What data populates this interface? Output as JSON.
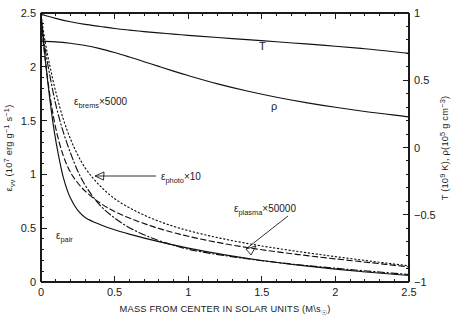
{
  "chart_data": {
    "type": "line",
    "title": "",
    "xlabel": "MASS FROM CENTER IN SOLAR UNITS (M\\s☉)",
    "ylabel_left": "ενν (10⁷ erg g⁻¹ s⁻¹)",
    "ylabel_right": "T (10⁹ K), ρ(10⁵ g cm⁻³)",
    "xlim": [
      0,
      2.5
    ],
    "ylim_left": [
      0,
      2.5
    ],
    "ylim_right": [
      -1,
      1
    ],
    "grid": false,
    "legend_position": "inline-annotations",
    "xticks": [
      "0",
      "0.5",
      "1",
      "1.5",
      "2",
      "2.5"
    ],
    "xtick_values": [
      0,
      0.5,
      1,
      1.5,
      2,
      2.5
    ],
    "yticks_left": [
      "0",
      "0.5",
      "1",
      "1.5",
      "2",
      "2.5"
    ],
    "ytick_values_left": [
      0,
      0.5,
      1,
      1.5,
      2,
      2.5
    ],
    "yticks_right": [
      "-1",
      "-0.5",
      "0",
      "0.5",
      "1"
    ],
    "ytick_values_right": [
      -1,
      -0.5,
      0,
      0.5,
      1
    ],
    "minor_ticks_per_interval": 4,
    "series": [
      {
        "name": "T",
        "label": "T",
        "axis": "right",
        "style": "solid",
        "x": [
          0,
          0.1,
          0.2,
          0.3,
          0.4,
          0.5,
          0.6,
          0.7,
          0.8,
          0.9,
          1.0,
          1.2,
          1.4,
          1.6,
          1.8,
          2.0,
          2.2,
          2.5
        ],
        "values": [
          0.99,
          0.96,
          0.935,
          0.915,
          0.9,
          0.885,
          0.873,
          0.862,
          0.852,
          0.843,
          0.834,
          0.818,
          0.802,
          0.786,
          0.77,
          0.753,
          0.734,
          0.7
        ]
      },
      {
        "name": "rho",
        "label": "ρ",
        "axis": "right",
        "style": "solid",
        "x": [
          0,
          0.1,
          0.2,
          0.3,
          0.4,
          0.5,
          0.6,
          0.7,
          0.8,
          0.9,
          1.0,
          1.2,
          1.4,
          1.6,
          1.8,
          2.0,
          2.2,
          2.5
        ],
        "values": [
          0.79,
          0.785,
          0.775,
          0.758,
          0.735,
          0.706,
          0.673,
          0.638,
          0.603,
          0.568,
          0.535,
          0.473,
          0.42,
          0.374,
          0.334,
          0.299,
          0.268,
          0.228
        ]
      },
      {
        "name": "epsilon_pair",
        "label": "εpair",
        "axis": "left",
        "style": "solid",
        "x": [
          0,
          0.03,
          0.06,
          0.09,
          0.12,
          0.15,
          0.2,
          0.25,
          0.3,
          0.4,
          0.5,
          0.6,
          0.8,
          1.0,
          1.25,
          1.5,
          1.75,
          2.0,
          2.25,
          2.5
        ],
        "values": [
          2.5,
          2.06,
          1.7,
          1.4,
          1.17,
          0.98,
          0.78,
          0.665,
          0.6,
          0.535,
          0.485,
          0.445,
          0.375,
          0.315,
          0.252,
          0.2,
          0.157,
          0.12,
          0.088,
          0.06
        ]
      },
      {
        "name": "epsilon_photo_x10",
        "label": "εphoto×10",
        "axis": "left",
        "style": "dashed",
        "x": [
          0,
          0.03,
          0.06,
          0.1,
          0.15,
          0.2,
          0.25,
          0.3,
          0.4,
          0.5,
          0.6,
          0.8,
          1.0,
          1.25,
          1.5,
          1.75,
          2.0,
          2.25,
          2.5
        ],
        "values": [
          2.42,
          2.05,
          1.74,
          1.43,
          1.18,
          1.02,
          0.92,
          0.845,
          0.735,
          0.655,
          0.595,
          0.498,
          0.425,
          0.355,
          0.3,
          0.255,
          0.215,
          0.178,
          0.14
        ]
      },
      {
        "name": "epsilon_plasma_x50000",
        "label": "εplasma×50000",
        "axis": "left",
        "style": "dashdot",
        "x": [
          0,
          0.03,
          0.06,
          0.1,
          0.15,
          0.2,
          0.25,
          0.3,
          0.4,
          0.5,
          0.6,
          0.8,
          1.0,
          1.1,
          1.25,
          1.5,
          1.75,
          2.0,
          2.25,
          2.5
        ],
        "values": [
          2.42,
          2.15,
          1.92,
          1.65,
          1.4,
          1.2,
          1.03,
          0.9,
          0.715,
          0.595,
          0.505,
          0.385,
          0.305,
          0.278,
          0.245,
          0.198,
          0.16,
          0.128,
          0.098,
          0.07
        ]
      },
      {
        "name": "epsilon_brems_x5000",
        "label": "εbrems×5000",
        "axis": "left",
        "style": "dotted",
        "x": [
          0,
          0.03,
          0.06,
          0.1,
          0.15,
          0.2,
          0.25,
          0.3,
          0.4,
          0.5,
          0.6,
          0.8,
          1.0,
          1.25,
          1.5,
          1.75,
          2.0,
          2.25,
          2.5
        ],
        "values": [
          2.48,
          2.22,
          2.01,
          1.77,
          1.52,
          1.33,
          1.18,
          1.06,
          0.895,
          0.775,
          0.69,
          0.565,
          0.478,
          0.398,
          0.335,
          0.283,
          0.236,
          0.192,
          0.15
        ]
      }
    ],
    "annotations": [
      {
        "id": "brems",
        "text": "εbrems×5000",
        "base": "ε",
        "sub": "brems",
        "suffix": "×5000"
      },
      {
        "id": "photo",
        "text": "εphoto×10",
        "base": "ε",
        "sub": "photo",
        "suffix": "×10"
      },
      {
        "id": "plasma",
        "text": "εplasma×50000",
        "base": "ε",
        "sub": "plasma",
        "suffix": "×50000"
      },
      {
        "id": "pair",
        "text": "εpair",
        "base": "ε",
        "sub": "pair",
        "suffix": ""
      },
      {
        "id": "t",
        "text": "T"
      },
      {
        "id": "rho",
        "text": "ρ"
      }
    ]
  },
  "labels": {
    "x_axis_title_main": "MASS FROM CENTER IN SOLAR UNITS (M\\s",
    "x_axis_title_sun": "☉",
    "x_axis_title_close": ")",
    "y_left_eps": "ε",
    "y_left_sub": "νν",
    "y_left_open": " (10",
    "y_left_exp1": "7",
    "y_left_mid": " erg g",
    "y_left_exp2": "−1",
    "y_left_mid2": " s",
    "y_left_exp3": "−1",
    "y_left_close": ")",
    "y_right_t": "T (10",
    "y_right_exp1": "9",
    "y_right_mid": " K), ",
    "y_right_rho": "ρ(10",
    "y_right_exp2": "5",
    "y_right_mid2": " g cm",
    "y_right_exp3": "−3",
    "y_right_close": ")",
    "label_T": "T",
    "label_rho": "ρ",
    "label_pair_base": "ε",
    "label_pair_sub": "pair",
    "label_brems_base": "ε",
    "label_brems_sub": "brems",
    "label_brems_suffix": "×5000",
    "label_photo_base": "ε",
    "label_photo_sub": "photo",
    "label_photo_suffix": "×10",
    "label_plasma_base": "ε",
    "label_plasma_sub": "plasma",
    "label_plasma_suffix": "×50000"
  },
  "ticklabels": {
    "x": [
      "0",
      "0.5",
      "1",
      "1.5",
      "2",
      "2.5"
    ],
    "left": [
      "0",
      "0.5",
      "1",
      "1.5",
      "2",
      "2.5"
    ],
    "right": [
      "−1",
      "−0.5",
      "0",
      "0.5",
      "1"
    ]
  },
  "colors": {
    "ink": "#1a1a1a",
    "background": "#ffffff",
    "curve": "#111111"
  }
}
